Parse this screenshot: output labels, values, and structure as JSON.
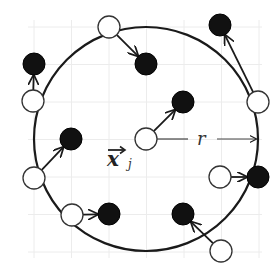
{
  "diagram": {
    "labels": {
      "radius": "r",
      "center_vector": "x",
      "center_subscript": "j"
    },
    "colors": {
      "stroke": "#1a1a1a",
      "filled": "#111111",
      "hollow": "#ffffff",
      "grid": "#ececec",
      "radius_line": "#444444"
    },
    "boundary_circle": {
      "cx": 146,
      "cy": 139,
      "r": 112
    },
    "center_point": {
      "cx": 146,
      "cy": 139
    },
    "white_points": [
      {
        "cx": 109,
        "cy": 27
      },
      {
        "cx": 33,
        "cy": 101
      },
      {
        "cx": 258,
        "cy": 102
      },
      {
        "cx": 146,
        "cy": 139
      },
      {
        "cx": 34,
        "cy": 178
      },
      {
        "cx": 72,
        "cy": 215
      },
      {
        "cx": 220,
        "cy": 177
      },
      {
        "cx": 221,
        "cy": 251
      }
    ],
    "black_points": [
      {
        "cx": 34,
        "cy": 64
      },
      {
        "cx": 146,
        "cy": 64
      },
      {
        "cx": 220,
        "cy": 25
      },
      {
        "cx": 183,
        "cy": 102
      },
      {
        "cx": 71,
        "cy": 139
      },
      {
        "cx": 258,
        "cy": 177
      },
      {
        "cx": 109,
        "cy": 214
      },
      {
        "cx": 183,
        "cy": 214
      }
    ],
    "arrows": [
      {
        "from": [
          109,
          27
        ],
        "to": [
          146,
          64
        ]
      },
      {
        "from": [
          33,
          101
        ],
        "to": [
          34,
          64
        ]
      },
      {
        "from": [
          258,
          102
        ],
        "to": [
          220,
          25
        ]
      },
      {
        "from": [
          146,
          139
        ],
        "to": [
          183,
          102
        ]
      },
      {
        "from": [
          34,
          178
        ],
        "to": [
          71,
          139
        ]
      },
      {
        "from": [
          72,
          215
        ],
        "to": [
          109,
          214
        ]
      },
      {
        "from": [
          220,
          177
        ],
        "to": [
          258,
          177
        ]
      },
      {
        "from": [
          221,
          251
        ],
        "to": [
          183,
          214
        ]
      }
    ]
  }
}
